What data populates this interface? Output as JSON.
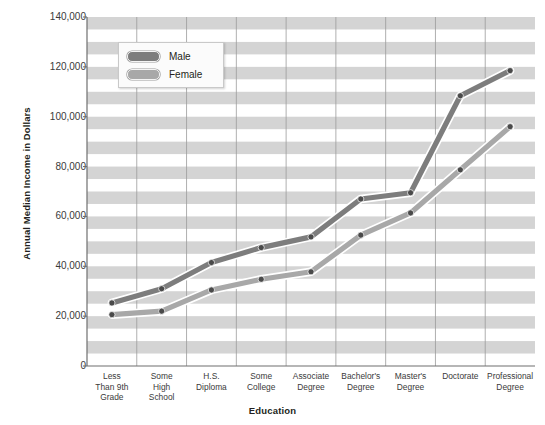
{
  "chart_data": {
    "type": "line",
    "title": "",
    "xlabel": "Education",
    "ylabel": "Annual Median Income in Dollars",
    "ylim": [
      0,
      140000
    ],
    "ytick_labels": [
      "0",
      "20,000",
      "40,000",
      "60,000",
      "80,000",
      "100,000",
      "120,000",
      "140,000"
    ],
    "ytick_values": [
      0,
      20000,
      40000,
      60000,
      80000,
      100000,
      120000,
      140000
    ],
    "grid": "horizontal-bands-and-vertical-lines",
    "legend_position": "top-left-inside",
    "categories": [
      "Less Than 9th Grade",
      "Some High School",
      "H.S. Diploma",
      "Some College",
      "Associate Degree",
      "Bachelor's Degree",
      "Master's Degree",
      "Doctorate",
      "Professional Degree"
    ],
    "category_lines": [
      [
        "Less",
        "Than 9th",
        "Grade"
      ],
      [
        "Some",
        "High",
        "School"
      ],
      [
        "H.S.",
        "Diploma"
      ],
      [
        "Some",
        "College"
      ],
      [
        "Associate",
        "Degree"
      ],
      [
        "Bachelor's",
        "Degree"
      ],
      [
        "Master's",
        "Degree"
      ],
      [
        "Doctorate"
      ],
      [
        "Professional",
        "Degree"
      ]
    ],
    "series": [
      {
        "name": "Male",
        "color": "#7d7d7d",
        "values": [
          25300,
          31000,
          41500,
          47500,
          51800,
          67000,
          69500,
          108400,
          118500
        ]
      },
      {
        "name": "Female",
        "color": "#a8a8a8",
        "values": [
          20600,
          22000,
          30500,
          34800,
          37800,
          52500,
          61400,
          78700,
          96000
        ]
      }
    ]
  },
  "legend": {
    "items": [
      {
        "label": "Male"
      },
      {
        "label": "Female"
      }
    ]
  },
  "colors": {
    "band": "#d4d4d4",
    "plot_background": "#ffffff",
    "axis": "#6f6f6f",
    "male": "#7d7d7d",
    "female": "#a8a8a8",
    "marker": "#4a4a4a"
  }
}
